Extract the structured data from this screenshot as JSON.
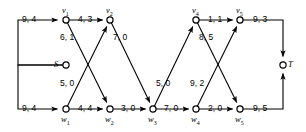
{
  "diagram": {
    "type": "directed-graph",
    "stroke_color": "#000000",
    "background": "#ffffff",
    "nodes": [
      {
        "id": "S",
        "label": "S",
        "sub": "",
        "x": 66,
        "y": 65,
        "label_dx": -12,
        "label_dy": -5
      },
      {
        "id": "v1",
        "label": "v",
        "sub": "1",
        "x": 66,
        "y": 20,
        "label_dx": -4,
        "label_dy": -14
      },
      {
        "id": "v2",
        "label": "v",
        "sub": "2",
        "x": 110,
        "y": 20,
        "label_dx": -4,
        "label_dy": -14
      },
      {
        "id": "v4",
        "label": "v",
        "sub": "4",
        "x": 196,
        "y": 20,
        "label_dx": -4,
        "label_dy": -14
      },
      {
        "id": "v5",
        "label": "v",
        "sub": "5",
        "x": 240,
        "y": 20,
        "label_dx": -4,
        "label_dy": -14
      },
      {
        "id": "T",
        "label": "T",
        "sub": "",
        "x": 283,
        "y": 65,
        "label_dx": 5,
        "label_dy": -5
      },
      {
        "id": "w1",
        "label": "w",
        "sub": "1",
        "x": 66,
        "y": 109,
        "label_dx": -5,
        "label_dy": 6
      },
      {
        "id": "w2",
        "label": "w",
        "sub": "2",
        "x": 110,
        "y": 109,
        "label_dx": -5,
        "label_dy": 6
      },
      {
        "id": "w3",
        "label": "w",
        "sub": "3",
        "x": 153,
        "y": 109,
        "label_dx": -5,
        "label_dy": 6
      },
      {
        "id": "w4",
        "label": "w",
        "sub": "4",
        "x": 196,
        "y": 109,
        "label_dx": -5,
        "label_dy": 6
      },
      {
        "id": "w5",
        "label": "w",
        "sub": "5",
        "x": 240,
        "y": 109,
        "label_dx": -5,
        "label_dy": 6
      }
    ],
    "edges": [
      {
        "from": "S",
        "to": "v1",
        "label": "9, 4",
        "label_x": 22,
        "label_y": 15,
        "kind": "elbow-up",
        "arrow": true
      },
      {
        "from": "S",
        "to": "w1",
        "label": "9, 4",
        "label_x": 22,
        "label_y": 104,
        "kind": "elbow-down",
        "arrow": true
      },
      {
        "from": "v1",
        "to": "v2",
        "label": "4, 3",
        "label_x": 78,
        "label_y": 15,
        "kind": "straight",
        "arrow": true
      },
      {
        "from": "v1",
        "to": "w2",
        "label": "6, 1",
        "label_x": 60,
        "label_y": 33,
        "kind": "straight",
        "arrow": true
      },
      {
        "from": "w1",
        "to": "v2",
        "label": "5, 0",
        "label_x": 60,
        "label_y": 79,
        "kind": "straight",
        "arrow": true
      },
      {
        "from": "w1",
        "to": "w2",
        "label": "4, 4",
        "label_x": 78,
        "label_y": 104,
        "kind": "straight",
        "arrow": true
      },
      {
        "from": "v2",
        "to": "w3",
        "label": "7, 0",
        "label_x": 113,
        "label_y": 33,
        "kind": "straight",
        "arrow": true
      },
      {
        "from": "w2",
        "to": "w3",
        "label": "3, 0",
        "label_x": 121,
        "label_y": 104,
        "kind": "straight",
        "arrow": true
      },
      {
        "from": "w3",
        "to": "v4",
        "label": "5, 0",
        "label_x": 156,
        "label_y": 79,
        "kind": "straight",
        "arrow": true
      },
      {
        "from": "w3",
        "to": "w4",
        "label": "7, 0",
        "label_x": 164,
        "label_y": 104,
        "kind": "straight",
        "arrow": true
      },
      {
        "from": "v4",
        "to": "v5",
        "label": "1, 1",
        "label_x": 208,
        "label_y": 15,
        "kind": "straight",
        "arrow": true
      },
      {
        "from": "v4",
        "to": "w5",
        "label": "8, 5",
        "label_x": 199,
        "label_y": 33,
        "kind": "straight",
        "arrow": true
      },
      {
        "from": "w4",
        "to": "v5",
        "label": "9, 2",
        "label_x": 190,
        "label_y": 79,
        "kind": "straight",
        "arrow": true
      },
      {
        "from": "w4",
        "to": "w5",
        "label": "2, 0",
        "label_x": 208,
        "label_y": 104,
        "kind": "straight",
        "arrow": true
      },
      {
        "from": "v5",
        "to": "T",
        "label": "9, 3",
        "label_x": 253,
        "label_y": 15,
        "kind": "elbow-up",
        "arrow": true
      },
      {
        "from": "w5",
        "to": "T",
        "label": "9, 5",
        "label_x": 253,
        "label_y": 104,
        "kind": "elbow-down",
        "arrow": true
      }
    ]
  }
}
